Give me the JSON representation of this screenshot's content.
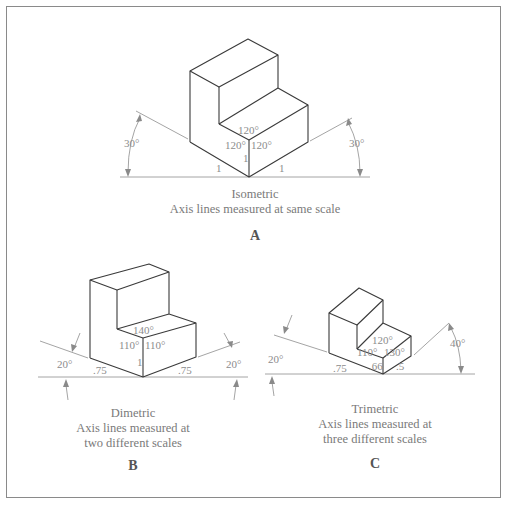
{
  "figures": [
    {
      "id": "A",
      "letter": "A",
      "title": "Isometric",
      "caption_lines": [
        "Axis lines measured at same scale"
      ],
      "angles": {
        "top": "120°",
        "left": "120°",
        "right": "120°"
      },
      "scales": {
        "left": "1",
        "vertical": "1",
        "right": "1"
      },
      "axis_angles": {
        "left": "30°",
        "right": "30°"
      }
    },
    {
      "id": "B",
      "letter": "B",
      "title": "Dimetric",
      "caption_lines": [
        "Axis lines measured at",
        "two different scales"
      ],
      "angles": {
        "top": "140°",
        "left": "110°",
        "right": "110°"
      },
      "scales": {
        "left": ".75",
        "vertical": "1",
        "right": ".75"
      },
      "axis_angles": {
        "left": "20°",
        "right": "20°"
      }
    },
    {
      "id": "C",
      "letter": "C",
      "title": "Trimetric",
      "caption_lines": [
        "Axis lines measured at",
        "three different scales"
      ],
      "angles": {
        "top": "120°",
        "left": "110°",
        "right": "130°"
      },
      "scales": {
        "left": ".75",
        "vertical": ".66",
        "right": ".5"
      },
      "axis_angles": {
        "left": "20°",
        "right": "40°"
      }
    }
  ],
  "colors": {
    "line": "#3a3a3a",
    "axis": "#9a9a9a",
    "text": "#8c8c8c",
    "border": "#8a8a8a"
  }
}
